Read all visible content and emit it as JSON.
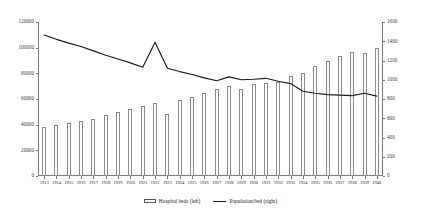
{
  "chart_data": {
    "type": "bar",
    "title": "",
    "subtitle": "",
    "xlabel": "",
    "ylabel": "",
    "y2label": "",
    "grid": false,
    "legend_position": "bottom",
    "categories": [
      "1913",
      "1914",
      "1915",
      "1916",
      "1917",
      "1918",
      "1919",
      "1920",
      "1921",
      "1922",
      "1923",
      "1924",
      "1925",
      "1926",
      "1927",
      "1928",
      "1929",
      "1930",
      "1931",
      "1932",
      "1933",
      "1934",
      "1935",
      "1936",
      "1937",
      "1938",
      "1939",
      "1940"
    ],
    "yticks_left": [
      0,
      20000,
      40000,
      60000,
      80000,
      100000,
      120000
    ],
    "ylim_left": [
      0,
      120000
    ],
    "yticks_right": [
      0,
      200,
      400,
      600,
      800,
      1000,
      1200,
      1400,
      1600
    ],
    "ylim_right": [
      0,
      1600
    ],
    "series": [
      {
        "name": "Hospital beds (left)",
        "axis": "left",
        "render": "bar",
        "values": [
          38000,
          39500,
          41000,
          42500,
          44500,
          47500,
          50000,
          52500,
          54500,
          57000,
          48000,
          59500,
          61500,
          64500,
          67500,
          70500,
          67500,
          71500,
          72500,
          73500,
          78000,
          80500,
          85500,
          90000,
          93500,
          96500,
          95500,
          99500
        ]
      },
      {
        "name": "Population/bed (right)",
        "axis": "right",
        "render": "line",
        "values": [
          1465,
          1420,
          1380,
          1345,
          1300,
          1255,
          1215,
          1175,
          1130,
          1390,
          1120,
          1085,
          1055,
          1020,
          990,
          1030,
          1000,
          1005,
          1015,
          985,
          960,
          880,
          860,
          845,
          840,
          835,
          860,
          830
        ]
      }
    ]
  },
  "legend": {
    "items": [
      {
        "label": "Hospital beds (left)",
        "marker": "bar-swatch"
      },
      {
        "label": "Population/bed (right)",
        "marker": "line-swatch"
      }
    ]
  },
  "colors": {
    "bar_fill": "#ffffff",
    "bar_stroke": "#8a8a8a",
    "line": "#1a1a1a",
    "axis": "#7a7a7a",
    "text": "#1a1a1a",
    "background": "#ffffff"
  }
}
